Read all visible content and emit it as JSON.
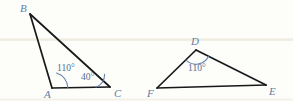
{
  "figure": {
    "background_color": "#fdfdfa",
    "line_color": "#16181a",
    "label_color": "#5d7fa6",
    "angle_color": "#4f6f96",
    "triangles": [
      {
        "name": "triangle-abc",
        "vertices": [
          {
            "id": "B",
            "label": "B",
            "x": 30,
            "y": 14,
            "label_x": 20,
            "label_y": 12
          },
          {
            "id": "A",
            "label": "A",
            "x": 52,
            "y": 88,
            "label_x": 44,
            "label_y": 98
          },
          {
            "id": "C",
            "label": "C",
            "x": 110,
            "y": 87,
            "label_x": 114,
            "label_y": 97
          }
        ],
        "angles": [
          {
            "at": "A",
            "label": "110°",
            "label_x": 57,
            "label_y": 71
          },
          {
            "at": "C",
            "label": "40°",
            "label_x": 81,
            "label_y": 80
          }
        ]
      },
      {
        "name": "triangle-def",
        "vertices": [
          {
            "id": "D",
            "label": "D",
            "x": 196,
            "y": 50,
            "label_x": 191,
            "label_y": 45
          },
          {
            "id": "F",
            "label": "F",
            "x": 157,
            "y": 88,
            "label_x": 147,
            "label_y": 97
          },
          {
            "id": "E",
            "label": "E",
            "x": 266,
            "y": 85,
            "label_x": 269,
            "label_y": 95
          }
        ],
        "angles": [
          {
            "at": "D",
            "label": "110°",
            "label_x": 188,
            "label_y": 71
          }
        ]
      }
    ]
  }
}
